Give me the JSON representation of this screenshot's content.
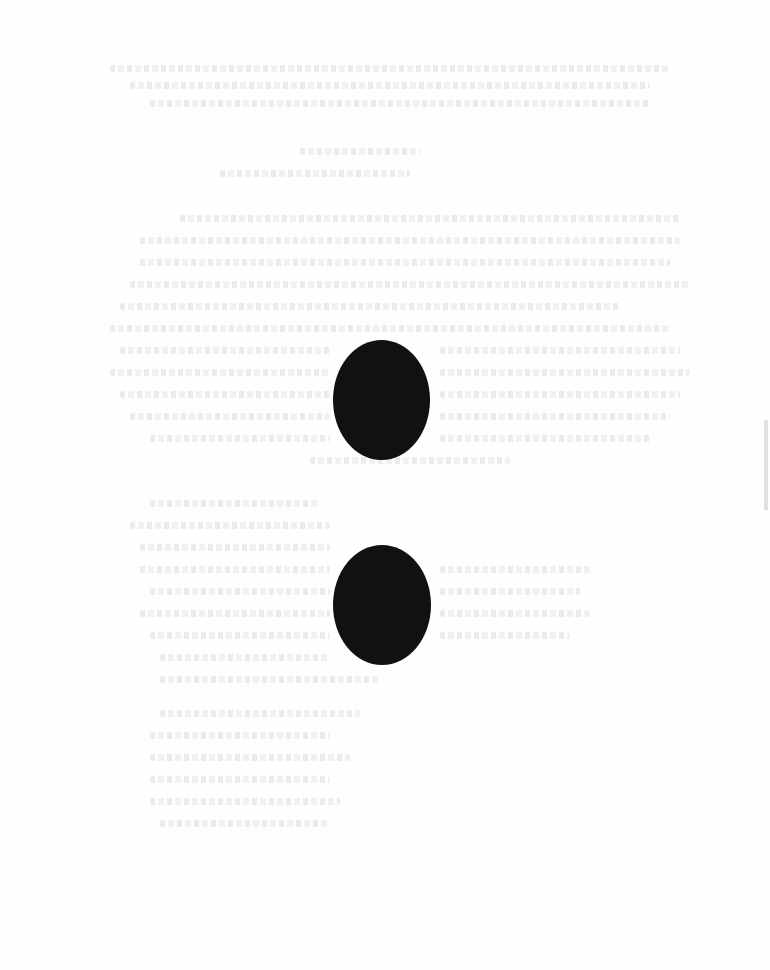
{
  "document": {
    "description": "Heavily faded scanned page; text illegible",
    "background_color": "#fefefe",
    "oval_color": "#111111",
    "ovals": [
      {
        "id": "oval-top",
        "x": 333,
        "y": 340,
        "w": 97,
        "h": 120
      },
      {
        "id": "oval-bottom",
        "x": 333,
        "y": 545,
        "w": 98,
        "h": 120
      }
    ],
    "faint_text_blocks": [
      {
        "id": "header-scribble",
        "lines": [
          {
            "x": 110,
            "y": 65,
            "w": 560
          },
          {
            "x": 130,
            "y": 82,
            "w": 520
          },
          {
            "x": 150,
            "y": 100,
            "w": 500
          }
        ]
      },
      {
        "id": "title",
        "lines": [
          {
            "x": 300,
            "y": 148,
            "w": 120
          },
          {
            "x": 220,
            "y": 170,
            "w": 190
          }
        ]
      },
      {
        "id": "paragraph-1",
        "lines": [
          {
            "x": 180,
            "y": 215,
            "w": 500
          },
          {
            "x": 140,
            "y": 237,
            "w": 540
          },
          {
            "x": 140,
            "y": 259,
            "w": 530
          },
          {
            "x": 130,
            "y": 281,
            "w": 560
          },
          {
            "x": 120,
            "y": 303,
            "w": 500
          },
          {
            "x": 110,
            "y": 325,
            "w": 560
          },
          {
            "x": 120,
            "y": 347,
            "w": 210
          },
          {
            "x": 440,
            "y": 347,
            "w": 240
          },
          {
            "x": 110,
            "y": 369,
            "w": 220
          },
          {
            "x": 440,
            "y": 369,
            "w": 250
          },
          {
            "x": 120,
            "y": 391,
            "w": 210
          },
          {
            "x": 440,
            "y": 391,
            "w": 240
          },
          {
            "x": 130,
            "y": 413,
            "w": 200
          },
          {
            "x": 440,
            "y": 413,
            "w": 230
          },
          {
            "x": 150,
            "y": 435,
            "w": 180
          },
          {
            "x": 440,
            "y": 435,
            "w": 210
          },
          {
            "x": 310,
            "y": 457,
            "w": 200
          }
        ]
      },
      {
        "id": "paragraph-2",
        "lines": [
          {
            "x": 150,
            "y": 500,
            "w": 170
          },
          {
            "x": 130,
            "y": 522,
            "w": 200
          },
          {
            "x": 140,
            "y": 544,
            "w": 190
          },
          {
            "x": 140,
            "y": 566,
            "w": 190
          },
          {
            "x": 440,
            "y": 566,
            "w": 150
          },
          {
            "x": 150,
            "y": 588,
            "w": 180
          },
          {
            "x": 440,
            "y": 588,
            "w": 140
          },
          {
            "x": 140,
            "y": 610,
            "w": 190
          },
          {
            "x": 440,
            "y": 610,
            "w": 150
          },
          {
            "x": 150,
            "y": 632,
            "w": 180
          },
          {
            "x": 440,
            "y": 632,
            "w": 130
          },
          {
            "x": 160,
            "y": 654,
            "w": 170
          },
          {
            "x": 160,
            "y": 676,
            "w": 220
          }
        ]
      },
      {
        "id": "paragraph-3",
        "lines": [
          {
            "x": 160,
            "y": 710,
            "w": 200
          },
          {
            "x": 150,
            "y": 732,
            "w": 180
          },
          {
            "x": 150,
            "y": 754,
            "w": 200
          },
          {
            "x": 150,
            "y": 776,
            "w": 180
          },
          {
            "x": 150,
            "y": 798,
            "w": 190
          },
          {
            "x": 160,
            "y": 820,
            "w": 170
          }
        ]
      }
    ],
    "edge_mark": {
      "x": 764,
      "y": 420,
      "h": 90
    }
  }
}
